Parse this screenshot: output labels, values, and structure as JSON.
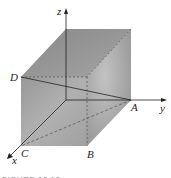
{
  "figure": {
    "axes": {
      "x": "x",
      "y": "y",
      "z": "z"
    },
    "points": {
      "A": "A",
      "B": "B",
      "C": "C",
      "D": "D"
    },
    "caption": "FIGURE 13.10"
  }
}
